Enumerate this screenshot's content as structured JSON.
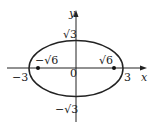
{
  "diagram": {
    "type": "ellipse-plot",
    "equation_hint": "x^2/9 + y^2/3 = 1",
    "axes": {
      "x_label": "x",
      "y_label": "y",
      "origin_label": "0"
    },
    "intercepts": {
      "x_neg": "−3",
      "x_pos": "3",
      "y_pos": "√3",
      "y_neg": "−√3"
    },
    "foci": {
      "left_label": "−√6",
      "right_label": "√6"
    },
    "colors": {
      "stroke": "#222222",
      "background": "#ffffff"
    }
  }
}
